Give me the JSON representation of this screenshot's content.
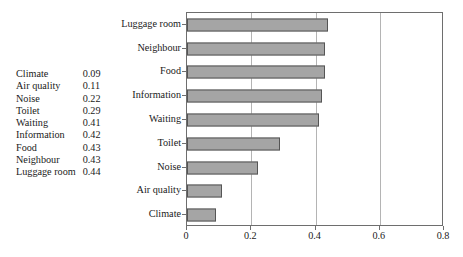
{
  "value_table": {
    "rows": [
      {
        "label": "Climate",
        "value": "0.09"
      },
      {
        "label": "Air quality",
        "value": "0.11"
      },
      {
        "label": "Noise",
        "value": "0.22"
      },
      {
        "label": "Toilet",
        "value": "0.29"
      },
      {
        "label": "Waiting",
        "value": "0.41"
      },
      {
        "label": "Information",
        "value": "0.42"
      },
      {
        "label": "Food",
        "value": "0.43"
      },
      {
        "label": "Neighbour",
        "value": "0.43"
      },
      {
        "label": "Luggage room",
        "value": "0.44"
      }
    ]
  },
  "chart_data": {
    "type": "bar",
    "orientation": "horizontal",
    "title": "",
    "xlabel": "",
    "ylabel": "",
    "categories": [
      "Luggage room",
      "Neighbour",
      "Food",
      "Information",
      "Waiting",
      "Toilet",
      "Noise",
      "Air quality",
      "Climate"
    ],
    "values": [
      0.44,
      0.43,
      0.43,
      0.42,
      0.41,
      0.29,
      0.22,
      0.11,
      0.09
    ],
    "xlim": [
      0,
      0.8
    ],
    "xticks": [
      0,
      0.2,
      0.4,
      0.6,
      0.8
    ],
    "xtick_labels": [
      "0",
      "0.2",
      "0.4",
      "0.6",
      "0.8"
    ],
    "gridlines_x": [
      0.2,
      0.4,
      0.6
    ],
    "grid": true,
    "legend": false,
    "bar_color": "#a5a5a5",
    "bar_edge_color": "#555555",
    "axis_color": "#6e6e6e",
    "grid_color": "#b4b4b4"
  }
}
